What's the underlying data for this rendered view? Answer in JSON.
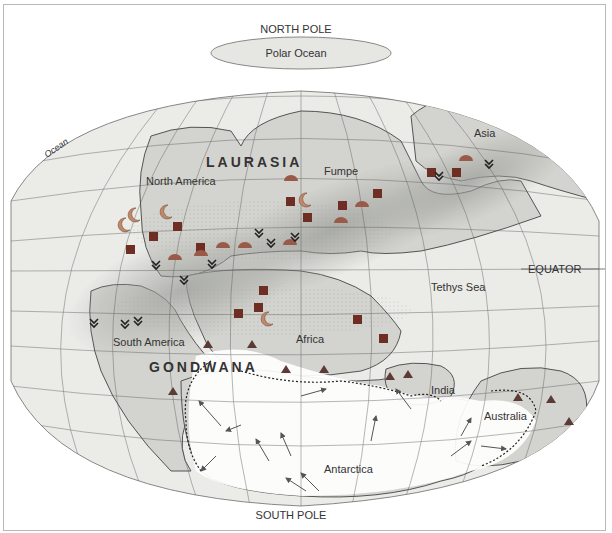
{
  "map": {
    "title_top": "NORTH POLE",
    "title_bottom": "SOUTH POLE",
    "polar_ocean": "Polar Ocean",
    "equator": "EQUATOR",
    "ocean_label": "Ocean",
    "supercontinents": [
      "LAURASIA",
      "GONDWANA"
    ],
    "continents": {
      "north_america": "North America",
      "europe": "Fumpe",
      "asia": "Asia",
      "south_america": "South America",
      "africa": "Africa",
      "india": "India",
      "australia": "Australia",
      "antarctica": "Antarctica"
    },
    "seas": {
      "tethys": "Tethys Sea"
    },
    "colors": {
      "land": "#d4d4d0",
      "ocean": "#ecece9",
      "arid_band": "#a7a9a4",
      "glacier": "#ffffff",
      "marker": "#7a3a2c",
      "marker_light": "#b56a5a",
      "triangle": "#5a3a36",
      "grid": "#555555"
    },
    "legend_symbols": [
      "square-marker",
      "crescent-marker",
      "dome-marker",
      "chevron-marker",
      "triangle-marker",
      "glacier-arrow"
    ]
  }
}
